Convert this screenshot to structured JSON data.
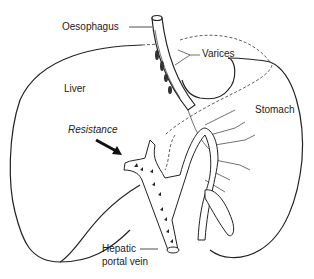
{
  "diagram": {
    "labels": {
      "oesophagus": "Oesophagus",
      "varices": "Varices",
      "liver": "Liver",
      "stomach": "Stomach",
      "resistance": "Resistance",
      "portal_vein_line1": "Hepatic",
      "portal_vein_line2": "portal vein"
    }
  }
}
